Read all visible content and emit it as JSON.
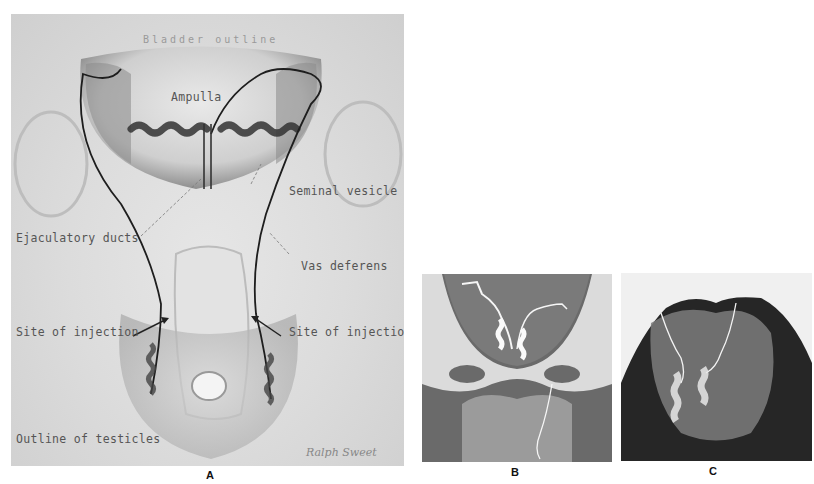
{
  "figure": {
    "panels": [
      {
        "id": "A",
        "letter": "A",
        "type": "anatomical-illustration",
        "annotations": {
          "bladder_outline": "Bladder outline",
          "ampulla": "Ampulla",
          "seminal_vesicle": "Seminal vesicle",
          "ejaculatory_ducts": "Ejaculatory ducts",
          "vas_deferens": "Vas deferens",
          "site_of_injection_left": "Site of injection",
          "site_of_injection_right": "Site of injection",
          "outline_of_testicles": "Outline of testicles"
        },
        "signature": "Ralph Sweet"
      },
      {
        "id": "B",
        "letter": "B",
        "type": "radiograph"
      },
      {
        "id": "C",
        "letter": "C",
        "type": "radiograph"
      }
    ]
  },
  "colors": {
    "background": "#ffffff",
    "illustration_base": "#dcdcdc",
    "duct_line": "#1e1e1e",
    "label_text": "#555555",
    "xray_dark": "#2a2a2a",
    "xray_light": "#f2f2f2"
  }
}
